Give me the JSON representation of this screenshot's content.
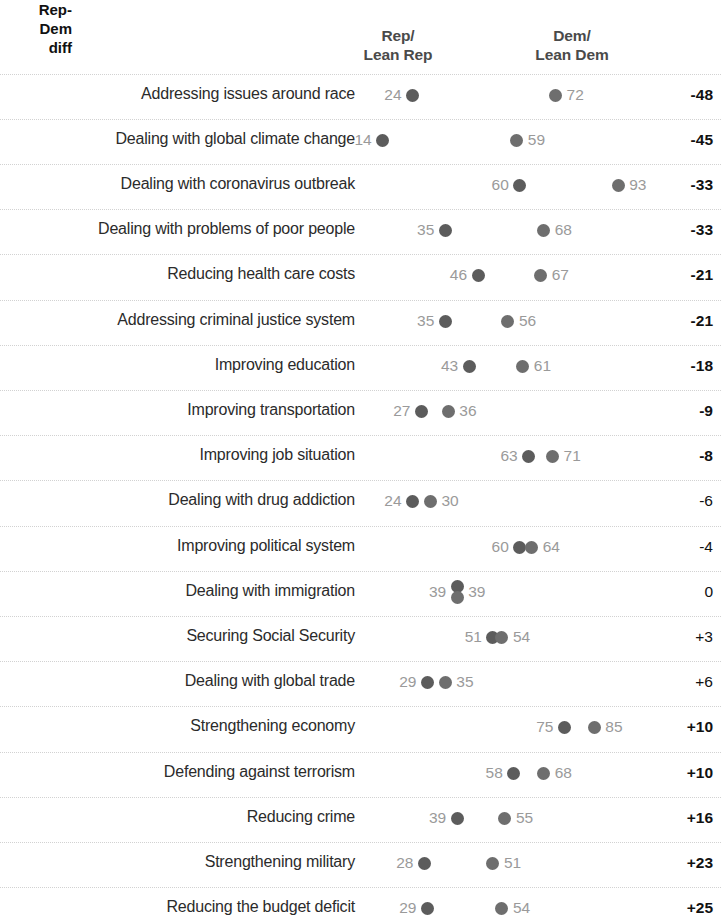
{
  "header": {
    "col_rep_line1": "Rep/",
    "col_rep_line2": "Lean Rep",
    "col_dem_line1": "Dem/",
    "col_dem_line2": "Lean Dem",
    "col_diff_line1": "Rep-",
    "col_diff_line2": "Dem",
    "col_diff_line3": "diff"
  },
  "colors": {
    "rep_dot": "#5c5c5c",
    "dem_dot": "#6e6e6e",
    "value_label": "#9a9a9a",
    "issue_label": "#2b2b2b",
    "rule": "#d2d2d2",
    "background": "#ffffff"
  },
  "chart_data": {
    "type": "scatter",
    "title": "",
    "xlabel": "",
    "ylabel": "",
    "xlim": [
      0,
      100
    ],
    "grid": false,
    "legend_position": "top",
    "series": [
      {
        "name": "Rep/Lean Rep",
        "values": [
          24,
          14,
          60,
          35,
          46,
          35,
          43,
          27,
          63,
          24,
          60,
          39,
          51,
          29,
          75,
          58,
          39,
          28,
          29
        ]
      },
      {
        "name": "Dem/Lean Dem",
        "values": [
          72,
          59,
          93,
          68,
          67,
          56,
          61,
          36,
          71,
          30,
          64,
          39,
          54,
          35,
          85,
          68,
          55,
          51,
          54
        ]
      }
    ],
    "categories": [
      "Addressing issues around race",
      "Dealing with global climate change",
      "Dealing with coronavirus outbreak",
      "Dealing with problems of poor people",
      "Reducing health care costs",
      "Addressing criminal justice system",
      "Improving education",
      "Improving transportation",
      "Improving job situation",
      "Dealing with drug addiction",
      "Improving political system",
      "Dealing with immigration",
      "Securing Social Security",
      "Dealing with global trade",
      "Strengthening economy",
      "Defending against terrorism",
      "Reducing crime",
      "Strengthening military",
      "Reducing the budget deficit"
    ],
    "diff_labels": [
      "-48",
      "-45",
      "-33",
      "-33",
      "-21",
      "-21",
      "-18",
      "-9",
      "-8",
      "-6",
      "-4",
      "0",
      "+3",
      "+6",
      "+10",
      "+10",
      "+16",
      "+23",
      "+25"
    ]
  },
  "rows": [
    {
      "label": "Addressing issues around race",
      "rep": 24,
      "dem": 72,
      "diff": "-48",
      "sig": true
    },
    {
      "label": "Dealing with global climate change",
      "rep": 14,
      "dem": 59,
      "diff": "-45",
      "sig": true
    },
    {
      "label": "Dealing with coronavirus outbreak",
      "rep": 60,
      "dem": 93,
      "diff": "-33",
      "sig": true
    },
    {
      "label": "Dealing with problems of poor people",
      "rep": 35,
      "dem": 68,
      "diff": "-33",
      "sig": true
    },
    {
      "label": "Reducing health care costs",
      "rep": 46,
      "dem": 67,
      "diff": "-21",
      "sig": true
    },
    {
      "label": "Addressing criminal justice system",
      "rep": 35,
      "dem": 56,
      "diff": "-21",
      "sig": true
    },
    {
      "label": "Improving education",
      "rep": 43,
      "dem": 61,
      "diff": "-18",
      "sig": true
    },
    {
      "label": "Improving transportation",
      "rep": 27,
      "dem": 36,
      "diff": "-9",
      "sig": true
    },
    {
      "label": "Improving job situation",
      "rep": 63,
      "dem": 71,
      "diff": "-8",
      "sig": true
    },
    {
      "label": "Dealing with drug addiction",
      "rep": 24,
      "dem": 30,
      "diff": "-6",
      "sig": false
    },
    {
      "label": "Improving political system",
      "rep": 60,
      "dem": 64,
      "diff": "-4",
      "sig": false
    },
    {
      "label": "Dealing with immigration",
      "rep": 39,
      "dem": 39,
      "diff": "0",
      "sig": false
    },
    {
      "label": "Securing Social Security",
      "rep": 51,
      "dem": 54,
      "diff": "+3",
      "sig": false
    },
    {
      "label": "Dealing with global trade",
      "rep": 29,
      "dem": 35,
      "diff": "+6",
      "sig": false
    },
    {
      "label": "Strengthening economy",
      "rep": 75,
      "dem": 85,
      "diff": "+10",
      "sig": true
    },
    {
      "label": "Defending against terrorism",
      "rep": 58,
      "dem": 68,
      "diff": "+10",
      "sig": true
    },
    {
      "label": "Reducing crime",
      "rep": 39,
      "dem": 55,
      "diff": "+16",
      "sig": true
    },
    {
      "label": "Strengthening military",
      "rep": 28,
      "dem": 51,
      "diff": "+23",
      "sig": true
    },
    {
      "label": "Reducing the budget deficit",
      "rep": 29,
      "dem": 54,
      "diff": "+25",
      "sig": true
    }
  ]
}
